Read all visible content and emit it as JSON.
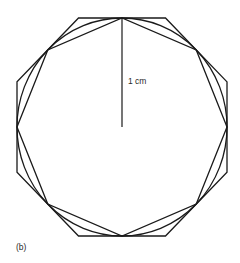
{
  "diagram": {
    "radius_label": "1 cm",
    "caption": "(b)",
    "polygon_sides": 8,
    "center": [
      122,
      127
    ],
    "radius": [
      105,
      109
    ],
    "stroke_color": "#1a1a1a",
    "elements": [
      "circumscribed regular octagon",
      "circle",
      "inscribed regular octagon",
      "radius line from center to top"
    ]
  }
}
